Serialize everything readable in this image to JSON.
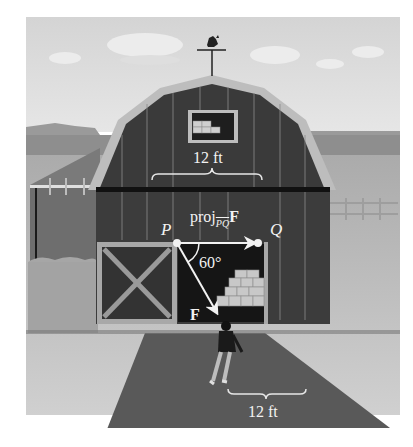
{
  "figure": {
    "labels": {
      "point_p": "P",
      "point_q": "Q",
      "projection_prefix": "proj",
      "projection_subscript": "PQ",
      "projection_vector": "F",
      "force_vector": "F",
      "angle": "60°",
      "top_dimension": "12 ft",
      "bottom_dimension": "12 ft"
    },
    "colors": {
      "sky": "#d8d8d8",
      "barn": "#3c3c3c",
      "trim": "#bdbdbd",
      "ground": "#5a5a5a",
      "field": "#c4c4c4",
      "vector": "#f2f2f2"
    }
  }
}
